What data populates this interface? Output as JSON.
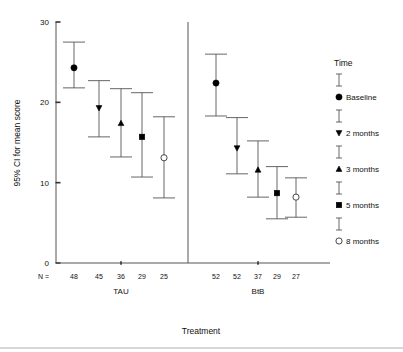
{
  "chart_data": {
    "type": "scatter",
    "title": "",
    "xlabel": "Treatment",
    "ylabel": "95% CI for mean score",
    "ylim": [
      0,
      30
    ],
    "yticks": [
      0,
      10,
      20,
      30
    ],
    "ytick_labels": [
      "0",
      "10",
      "20",
      "30"
    ],
    "grid": false,
    "legend_position": "right",
    "legend_title": "Time",
    "n_row_label": "N =",
    "groups": [
      "TAU",
      "BtB"
    ],
    "series": [
      {
        "name": "Baseline",
        "marker": "filled-circle"
      },
      {
        "name": "2 months",
        "marker": "down-triangle"
      },
      {
        "name": "3 months",
        "marker": "up-triangle"
      },
      {
        "name": "5 months",
        "marker": "filled-square"
      },
      {
        "name": "8 months",
        "marker": "open-circle"
      }
    ],
    "points": [
      {
        "group": "TAU",
        "time": "Baseline",
        "marker": "filled-circle",
        "n": 48,
        "mean": 24.3,
        "ci_low": 21.8,
        "ci_high": 27.5
      },
      {
        "group": "TAU",
        "time": "2 months",
        "marker": "down-triangle",
        "n": 45,
        "mean": 19.3,
        "ci_low": 15.7,
        "ci_high": 22.7
      },
      {
        "group": "TAU",
        "time": "3 months",
        "marker": "up-triangle",
        "n": 36,
        "mean": 17.4,
        "ci_low": 13.2,
        "ci_high": 21.7
      },
      {
        "group": "TAU",
        "time": "5 months",
        "marker": "filled-square",
        "n": 29,
        "mean": 15.7,
        "ci_low": 10.7,
        "ci_high": 21.2
      },
      {
        "group": "TAU",
        "time": "8 months",
        "marker": "open-circle",
        "n": 25,
        "mean": 13.1,
        "ci_low": 8.1,
        "ci_high": 18.2
      },
      {
        "group": "BtB",
        "time": "Baseline",
        "marker": "filled-circle",
        "n": 52,
        "mean": 22.4,
        "ci_low": 18.3,
        "ci_high": 26.0
      },
      {
        "group": "BtB",
        "time": "2 months",
        "marker": "down-triangle",
        "n": 52,
        "mean": 14.3,
        "ci_low": 11.1,
        "ci_high": 18.1
      },
      {
        "group": "BtB",
        "time": "3 months",
        "marker": "up-triangle",
        "n": 37,
        "mean": 11.6,
        "ci_low": 8.2,
        "ci_high": 15.2
      },
      {
        "group": "BtB",
        "time": "5 months",
        "marker": "filled-square",
        "n": 29,
        "mean": 8.7,
        "ci_low": 5.5,
        "ci_high": 12.0
      },
      {
        "group": "BtB",
        "time": "8 months",
        "marker": "open-circle",
        "n": 27,
        "mean": 8.2,
        "ci_low": 5.7,
        "ci_high": 10.6
      }
    ],
    "n_values": {
      "TAU": [
        48,
        45,
        36,
        29,
        25
      ],
      "BtB": [
        52,
        52,
        37,
        29,
        27
      ]
    }
  },
  "colors": {
    "marker": "#000000",
    "line": "#555555",
    "text": "#111111",
    "background": "#ffffff"
  }
}
